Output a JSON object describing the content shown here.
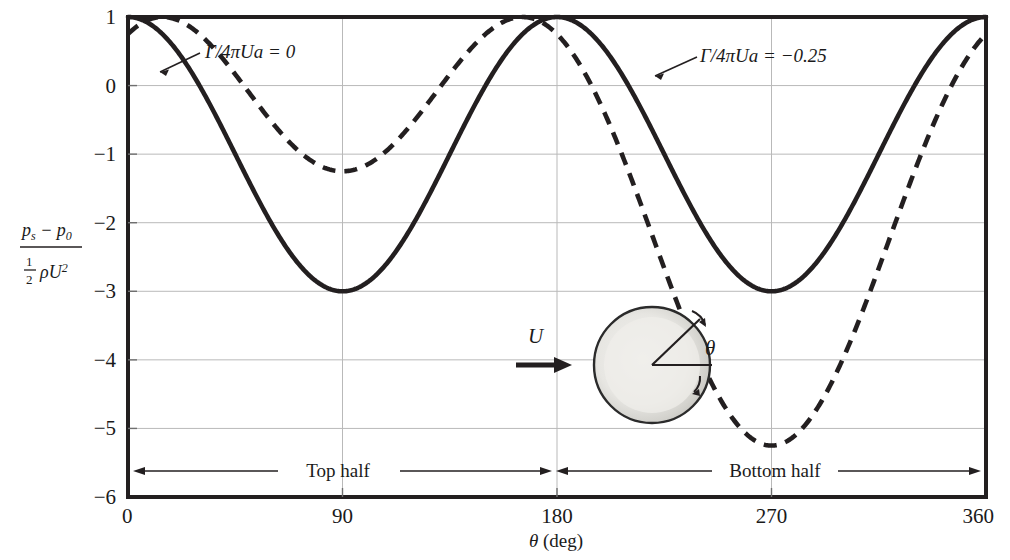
{
  "chart_data": {
    "type": "line",
    "title": "",
    "xlabel": "θ (deg)",
    "ylabel": "(p_s - p_0) / (1/2 ρ U^2)",
    "xlim": [
      0,
      360
    ],
    "ylim": [
      -6,
      1
    ],
    "xticks": [
      "0",
      "90",
      "180",
      "270",
      "360"
    ],
    "xtick_values": [
      0,
      90,
      180,
      270,
      360
    ],
    "yticks": [
      "1",
      "0",
      "−1",
      "−2",
      "−3",
      "−4",
      "−5",
      "−6"
    ],
    "ytick_values": [
      1,
      0,
      -1,
      -2,
      -3,
      -4,
      -5,
      -6
    ],
    "grid": true,
    "legend_position": "inline-annotations",
    "formula": "Cp = 1 - (2*sin(theta) + K)^2, K = 2*(Gamma/4*pi*U*a)",
    "series": [
      {
        "name": "Γ/4πUa = 0",
        "style": "solid",
        "color": "#231f20",
        "K": 0,
        "x": [
          0,
          15,
          30,
          45,
          60,
          75,
          90,
          105,
          120,
          135,
          150,
          165,
          180,
          195,
          210,
          225,
          240,
          255,
          270,
          285,
          300,
          315,
          330,
          345,
          360
        ],
        "y": [
          1,
          0.732,
          0,
          -1,
          -2,
          -2.732,
          -3,
          -2.732,
          -2,
          -1,
          0,
          0.732,
          1,
          0.732,
          0,
          -1,
          -2,
          -2.732,
          -3,
          -2.732,
          -2,
          -1,
          0,
          0.732,
          1
        ]
      },
      {
        "name": "Γ/4πUa = −0.25",
        "style": "dashed",
        "color": "#231f20",
        "K": -0.5,
        "x": [
          0,
          15,
          30,
          45,
          60,
          75,
          90,
          105,
          120,
          135,
          150,
          165,
          180,
          195,
          210,
          225,
          240,
          255,
          270,
          285,
          300,
          315,
          330,
          345,
          360
        ],
        "y": [
          0.75,
          0.25,
          -0.75,
          -2.06,
          -3.35,
          -4.32,
          -4.7,
          -4.32,
          -3.35,
          -2.06,
          -0.75,
          0.25,
          0.75,
          0.68,
          0.44,
          0.06,
          -0.35,
          -0.66,
          -0.77,
          -0.66,
          -0.35,
          0.06,
          0.44,
          0.68,
          0.75
        ]
      }
    ],
    "annotations": [
      {
        "id": "ann-gamma-0",
        "text": "Γ/4πUa = 0",
        "x": 205,
        "y": 52
      },
      {
        "id": "ann-gamma-025",
        "text": "Γ/4πUa = −0.25",
        "x": 700,
        "y": 56
      },
      {
        "id": "span-top-half",
        "text": "Top half",
        "x": 330,
        "y": 471
      },
      {
        "id": "span-bottom-half",
        "text": "Bottom half",
        "x": 768,
        "y": 471
      }
    ],
    "inset": {
      "name": "rotating-cylinder-diagram",
      "flow_label": "U",
      "angle_label": "θ"
    }
  },
  "axis": {
    "y_label_numerator": "p",
    "y_label_num_sub": "s",
    "y_label_num_minus": "− p",
    "y_label_num_sub2": "0",
    "y_label_denom_half_top": "1",
    "y_label_denom_half_bot": "2",
    "y_label_denom_rho": "ρU",
    "y_label_denom_exp": "2",
    "x_label_theta": "θ",
    "x_label_units": "(deg)"
  }
}
